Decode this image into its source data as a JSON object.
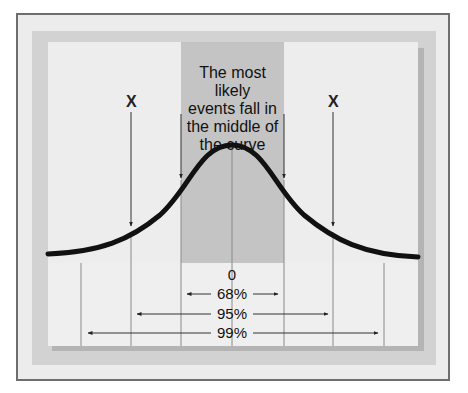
{
  "diagram": {
    "caption": "The most likely events fall in the middle of the curve",
    "caption_lines": [
      "The most likely",
      "events fall in",
      "the middle of",
      "the curve"
    ],
    "outlier_markers": [
      "X",
      "X"
    ],
    "center_label": "0",
    "ranges": [
      {
        "label": "68%",
        "span": "±1 standard deviation"
      },
      {
        "label": "95%",
        "span": "±2 standard deviations"
      },
      {
        "label": "99%",
        "span": "±3 standard deviations"
      }
    ],
    "colors": {
      "frame_border": "#6e6e6e",
      "frame_fill": "#ececec",
      "band": "#d2d2d2",
      "panel": "#ededed",
      "center_band": "#c4c4c4",
      "curve": "#111111"
    }
  }
}
